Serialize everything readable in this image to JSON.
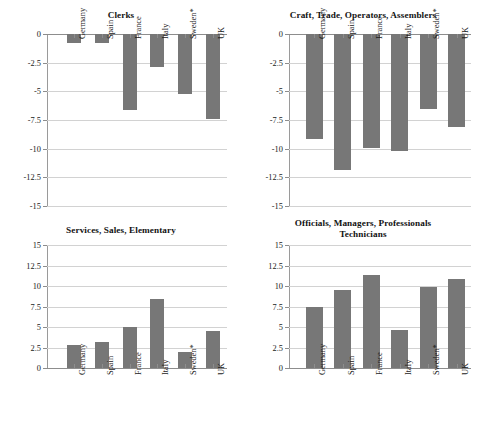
{
  "figure": {
    "categories": [
      "Germany",
      "Spain",
      "France",
      "Italy",
      "Sweden*",
      "UK"
    ]
  },
  "chart_data": [
    {
      "id": "clerks",
      "type": "bar",
      "title": "Clerks",
      "categories": [
        "Germany",
        "Spain",
        "France",
        "Italy",
        "Sweden*",
        "UK"
      ],
      "values": [
        -0.8,
        -0.8,
        -6.6,
        -2.9,
        -5.2,
        -7.4
      ],
      "xlabel": "",
      "ylabel": "",
      "ylim": [
        -15,
        0
      ],
      "yticks": [
        0,
        -2.5,
        -5,
        -7.5,
        -10,
        -12.5,
        -15
      ],
      "yticklabels": [
        "0",
        "-2.5",
        "-5",
        "-7.5",
        "-10",
        "-12.5",
        "-15"
      ],
      "grid": true,
      "legend": false,
      "bar_color": "#777777",
      "label_position": "inside-plot"
    },
    {
      "id": "craft",
      "type": "bar",
      "title": "Craft, Trade, Operators, Assemblers",
      "categories": [
        "Germany",
        "Spain",
        "France",
        "Italy",
        "Sweden*",
        "UK"
      ],
      "values": [
        -9.2,
        -11.9,
        -9.9,
        -10.2,
        -6.5,
        -8.1
      ],
      "xlabel": "",
      "ylabel": "",
      "ylim": [
        -15,
        0
      ],
      "yticks": [
        0,
        -2.5,
        -5,
        -7.5,
        -10,
        -12.5,
        -15
      ],
      "yticklabels": [
        "0",
        "-2.5",
        "-5",
        "-7.5",
        "-10",
        "-12.5",
        "-15"
      ],
      "grid": true,
      "legend": false,
      "bar_color": "#777777",
      "label_position": "inside-plot"
    },
    {
      "id": "services",
      "type": "bar",
      "title": "Services, Sales, Elementary",
      "categories": [
        "Germany",
        "Spain",
        "France",
        "Italy",
        "Sweden*",
        "UK"
      ],
      "values": [
        2.8,
        3.2,
        5.0,
        8.4,
        1.9,
        4.5
      ],
      "xlabel": "",
      "ylabel": "",
      "ylim": [
        0,
        15
      ],
      "yticks": [
        15,
        12.5,
        10,
        7.5,
        5,
        2.5,
        0
      ],
      "yticklabels": [
        "15",
        "12.5",
        "10",
        "7.5",
        "5",
        "2.5",
        "0"
      ],
      "grid": true,
      "legend": false,
      "bar_color": "#777777",
      "label_position": "below-axis"
    },
    {
      "id": "officials",
      "type": "bar",
      "title": "Officials, Managers, Professionals Technicians",
      "title_line1": "Officials, Managers, Professionals",
      "title_line2": "Technicians",
      "categories": [
        "Germany",
        "Spain",
        "France",
        "Italy",
        "Sweden*",
        "UK"
      ],
      "values": [
        7.4,
        9.5,
        11.4,
        4.6,
        9.9,
        10.8
      ],
      "xlabel": "",
      "ylabel": "",
      "ylim": [
        0,
        15
      ],
      "yticks": [
        15,
        12.5,
        10,
        7.5,
        5,
        2.5,
        0
      ],
      "yticklabels": [
        "15",
        "12.5",
        "10",
        "7.5",
        "5",
        "2.5",
        "0"
      ],
      "grid": true,
      "legend": false,
      "bar_color": "#777777",
      "label_position": "below-axis"
    }
  ]
}
